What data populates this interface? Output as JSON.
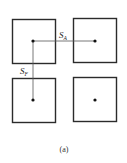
{
  "figure": {
    "caption": "(a)",
    "labels": {
      "horizontal_spacing": {
        "main": "S",
        "sub": "A"
      },
      "vertical_spacing": {
        "main": "S",
        "sub": "F"
      }
    },
    "cells": [
      {
        "id": "top-left",
        "has_center_dot": true
      },
      {
        "id": "top-right",
        "has_center_dot": true
      },
      {
        "id": "bottom-left",
        "has_center_dot": true
      },
      {
        "id": "bottom-right",
        "has_center_dot": true
      }
    ],
    "colors": {
      "stroke": "#2b2b2b",
      "connector": "#555555",
      "dot": "#111111"
    }
  }
}
